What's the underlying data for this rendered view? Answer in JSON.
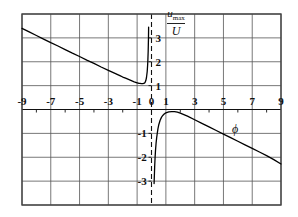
{
  "figure": {
    "name": "umax-over-U-vs-phi-plot",
    "yaxis_label_numerator": "u",
    "yaxis_label_numerator_sub": "max",
    "yaxis_label_denominator": "U",
    "xaxis_label": "ϕ"
  },
  "chart_data": {
    "type": "line",
    "title": "",
    "xlabel": "ϕ",
    "ylabel": "u_max / U",
    "xlim": [
      -9,
      9
    ],
    "ylim": [
      -4,
      4
    ],
    "grid": true,
    "legend": false,
    "xticks": [
      -9,
      -7,
      -5,
      -3,
      -1,
      0,
      1,
      3,
      5,
      7,
      9
    ],
    "xtick_labels": [
      "-9",
      "-7",
      "-5",
      "-3",
      "-1",
      "0",
      "1",
      "3",
      "5",
      "7",
      "9"
    ],
    "xminor_ticks": [
      -8,
      -6,
      -4,
      -2,
      2,
      4,
      6,
      8
    ],
    "yticks": [
      3,
      2,
      1,
      -1,
      -2,
      -3
    ],
    "ytick_labels": [
      "3",
      "2",
      "1",
      "-1",
      "-2",
      "-3"
    ],
    "gridlines_x": [
      -9,
      -7,
      -5,
      -3,
      -1,
      1,
      3,
      5,
      7,
      9
    ],
    "gridlines_y": [
      -4,
      -3,
      -2,
      -1,
      0,
      1,
      2,
      3,
      4
    ],
    "axis_y_style": "dashed",
    "series": [
      {
        "name": "upper-branch",
        "comment": "branch for phi < 0, asymptotic to +infinity as phi -> 0-",
        "x": [
          -9.0,
          -8.5,
          -8.0,
          -7.5,
          -7.0,
          -6.5,
          -6.0,
          -5.5,
          -5.0,
          -4.5,
          -4.0,
          -3.5,
          -3.0,
          -2.5,
          -2.2,
          -2.0,
          -1.8,
          -1.6,
          -1.4,
          -1.2,
          -1.0,
          -0.9,
          -0.8,
          -0.7,
          -0.6,
          -0.5,
          -0.45,
          -0.4,
          -0.35,
          -0.3,
          -0.27,
          -0.25,
          -0.23,
          -0.21,
          -0.2
        ],
        "y": [
          3.4,
          3.25,
          3.1,
          2.95,
          2.8,
          2.66,
          2.51,
          2.36,
          2.22,
          2.07,
          1.93,
          1.78,
          1.64,
          1.5,
          1.42,
          1.36,
          1.31,
          1.26,
          1.21,
          1.16,
          1.12,
          1.1,
          1.09,
          1.08,
          1.08,
          1.1,
          1.13,
          1.2,
          1.33,
          1.58,
          1.85,
          2.1,
          2.45,
          3.0,
          3.45
        ]
      },
      {
        "name": "lower-branch",
        "comment": "branch for phi > 0, asymptotic to -infinity as phi -> 0+, rising to a maximum near phi = 1.5 then decaying",
        "x": [
          0.18,
          0.2,
          0.22,
          0.25,
          0.28,
          0.32,
          0.36,
          0.4,
          0.45,
          0.5,
          0.6,
          0.7,
          0.8,
          0.9,
          1.0,
          1.2,
          1.4,
          1.6,
          1.8,
          2.0,
          2.5,
          3.0,
          3.5,
          4.0,
          4.5,
          5.0,
          5.5,
          6.0,
          6.5,
          7.0,
          7.5,
          8.0,
          8.5,
          9.0
        ],
        "y": [
          -3.1,
          -2.75,
          -2.4,
          -2.0,
          -1.7,
          -1.4,
          -1.18,
          -1.0,
          -0.8,
          -0.65,
          -0.45,
          -0.32,
          -0.24,
          -0.18,
          -0.14,
          -0.1,
          -0.09,
          -0.09,
          -0.11,
          -0.15,
          -0.28,
          -0.43,
          -0.58,
          -0.73,
          -0.88,
          -1.03,
          -1.18,
          -1.33,
          -1.48,
          -1.63,
          -1.78,
          -1.93,
          -2.1,
          -2.28
        ]
      }
    ]
  }
}
